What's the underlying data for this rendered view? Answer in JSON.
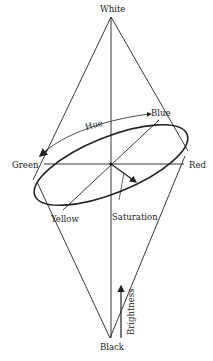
{
  "diagram": {
    "labels": {
      "top": "White",
      "bottom": "Black",
      "left": "Green",
      "right": "Red",
      "back": "Blue",
      "front": "Yellow",
      "hue": "Hue",
      "saturation": "Saturation",
      "brightness": "Brightness"
    },
    "colors": {
      "line": "#222222",
      "background": "#ffffff"
    }
  }
}
